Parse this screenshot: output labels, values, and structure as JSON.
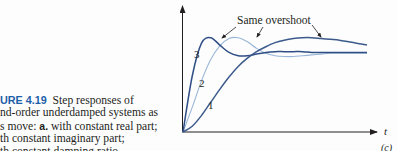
{
  "caption": {
    "figure_label": "URE 4.19",
    "line1_rest": "Step responses of",
    "line2": "nd-order underdamped systems as",
    "line3_pre": "s move: ",
    "line3_bold": "a.",
    "line3_post": " with constant real part;",
    "line4": "th constant imaginary part;",
    "line5": "th constant damping ratio"
  },
  "chart_data": {
    "type": "line",
    "panel_label": "(c)",
    "xlabel": "t",
    "ylabel": "",
    "annotation": "Same overshoot",
    "grid": false,
    "legend_position": "none",
    "series": [
      {
        "name": "1",
        "color": "#3d5a8c",
        "x": [
          0,
          0.5,
          1,
          1.5,
          2,
          2.5,
          3,
          3.5,
          4,
          4.5,
          5,
          5.5,
          6,
          6.5,
          7,
          7.5,
          8,
          8.5,
          9,
          9.5,
          10
        ],
        "y": [
          0,
          0.07,
          0.2,
          0.36,
          0.52,
          0.67,
          0.8,
          0.9,
          0.98,
          1.04,
          1.09,
          1.12,
          1.14,
          1.15,
          1.15,
          1.14,
          1.13,
          1.12,
          1.1,
          1.08,
          1.06
        ]
      },
      {
        "name": "2",
        "color": "#9ab6d6",
        "x": [
          0,
          0.5,
          1,
          1.5,
          2,
          2.5,
          3,
          3.5,
          4,
          4.5,
          5,
          5.5,
          6,
          6.5,
          7,
          7.5,
          8,
          8.5,
          9,
          9.5,
          10
        ],
        "y": [
          0,
          0.3,
          0.62,
          0.88,
          1.05,
          1.14,
          1.15,
          1.1,
          1.02,
          0.96,
          0.93,
          0.92,
          0.92,
          0.93,
          0.94,
          0.95,
          0.96,
          0.96,
          0.96,
          0.96,
          0.96
        ]
      },
      {
        "name": "3",
        "color": "#2f4f85",
        "x": [
          0,
          0.5,
          1,
          1.5,
          2,
          2.5,
          3,
          3.5,
          4,
          4.5,
          5,
          5.5,
          6,
          6.5,
          7,
          7.5,
          8,
          8.5,
          9,
          9.5,
          10
        ],
        "y": [
          0,
          0.68,
          1.08,
          1.15,
          1.06,
          0.97,
          0.93,
          0.93,
          0.95,
          0.97,
          0.98,
          0.98,
          0.98,
          0.98,
          0.97,
          0.97,
          0.97,
          0.97,
          0.97,
          0.97,
          0.97
        ]
      }
    ]
  }
}
